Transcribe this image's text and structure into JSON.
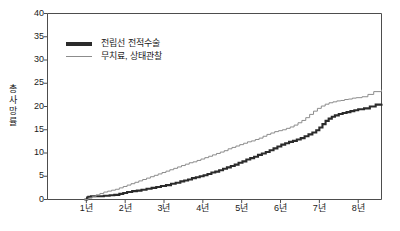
{
  "chart_data": {
    "type": "line",
    "title": "",
    "subtitle": "",
    "xlabel": "",
    "ylabel": "총사망률",
    "xlim": [
      0,
      8.6
    ],
    "ylim": [
      0,
      40
    ],
    "grid": false,
    "legend_position": "top-left",
    "x_ticks": [
      {
        "value": 1,
        "label": "1년"
      },
      {
        "value": 2,
        "label": "2년"
      },
      {
        "value": 3,
        "label": "3년"
      },
      {
        "value": 4,
        "label": "4년"
      },
      {
        "value": 5,
        "label": "5년"
      },
      {
        "value": 6,
        "label": "6년"
      },
      {
        "value": 7,
        "label": "7년"
      },
      {
        "value": 8,
        "label": "8년"
      }
    ],
    "y_ticks": [
      {
        "value": 0,
        "label": "0"
      },
      {
        "value": 5,
        "label": "5"
      },
      {
        "value": 10,
        "label": "10"
      },
      {
        "value": 15,
        "label": "15"
      },
      {
        "value": 20,
        "label": "20"
      },
      {
        "value": 25,
        "label": "25"
      },
      {
        "value": 30,
        "label": "30"
      },
      {
        "value": 35,
        "label": "35"
      },
      {
        "value": 40,
        "label": "40"
      }
    ],
    "series": [
      {
        "name": "전립선 전적수술",
        "color": "#2b2b2b",
        "width": 2.1,
        "step": true,
        "x": [
          0.95,
          1.02,
          1.05,
          1.12,
          1.3,
          1.45,
          1.6,
          1.72,
          1.85,
          1.95,
          2.05,
          2.18,
          2.3,
          2.42,
          2.55,
          2.68,
          2.8,
          2.92,
          3.05,
          3.18,
          3.3,
          3.42,
          3.52,
          3.62,
          3.72,
          3.82,
          3.92,
          4.02,
          4.12,
          4.22,
          4.32,
          4.42,
          4.52,
          4.62,
          4.72,
          4.82,
          4.92,
          5.02,
          5.12,
          5.22,
          5.32,
          5.42,
          5.52,
          5.62,
          5.72,
          5.82,
          5.92,
          6.02,
          6.12,
          6.22,
          6.32,
          6.42,
          6.52,
          6.62,
          6.72,
          6.82,
          6.92,
          7.0,
          7.08,
          7.16,
          7.24,
          7.32,
          7.4,
          7.5,
          7.6,
          7.7,
          7.8,
          7.9,
          8.0,
          8.15,
          8.3,
          8.45,
          8.6
        ],
        "y": [
          0.0,
          0.4,
          0.6,
          0.7,
          0.7,
          0.8,
          0.9,
          1.0,
          1.2,
          1.4,
          1.6,
          1.8,
          1.9,
          2.1,
          2.3,
          2.5,
          2.7,
          2.9,
          3.1,
          3.4,
          3.6,
          3.9,
          4.1,
          4.3,
          4.6,
          4.8,
          5.0,
          5.2,
          5.5,
          5.8,
          6.0,
          6.3,
          6.6,
          6.9,
          7.2,
          7.5,
          7.9,
          8.2,
          8.6,
          8.9,
          9.2,
          9.6,
          9.9,
          10.2,
          10.6,
          11.0,
          11.4,
          11.8,
          12.1,
          12.4,
          12.6,
          12.9,
          13.2,
          13.6,
          14.0,
          14.4,
          14.9,
          15.5,
          16.2,
          16.9,
          17.4,
          17.8,
          18.1,
          18.4,
          18.6,
          18.8,
          19.0,
          19.2,
          19.4,
          19.6,
          20.0,
          20.4,
          20.6
        ]
      },
      {
        "name": "무치료, 상태관찰",
        "color": "#8c8c8c",
        "width": 1.0,
        "step": true,
        "x": [
          0.95,
          1.05,
          1.15,
          1.25,
          1.35,
          1.45,
          1.55,
          1.65,
          1.75,
          1.85,
          1.95,
          2.05,
          2.15,
          2.25,
          2.35,
          2.45,
          2.55,
          2.65,
          2.75,
          2.85,
          2.95,
          3.05,
          3.15,
          3.25,
          3.35,
          3.45,
          3.55,
          3.65,
          3.75,
          3.85,
          3.95,
          4.05,
          4.15,
          4.25,
          4.35,
          4.45,
          4.55,
          4.65,
          4.75,
          4.85,
          4.95,
          5.05,
          5.15,
          5.25,
          5.35,
          5.45,
          5.55,
          5.65,
          5.75,
          5.85,
          5.95,
          6.05,
          6.15,
          6.25,
          6.35,
          6.45,
          6.55,
          6.65,
          6.75,
          6.85,
          6.95,
          7.05,
          7.15,
          7.25,
          7.35,
          7.45,
          7.55,
          7.65,
          7.75,
          7.85,
          7.95,
          8.1,
          8.25,
          8.4,
          8.6
        ],
        "y": [
          0.0,
          0.3,
          0.6,
          1.0,
          1.3,
          1.6,
          1.8,
          2.0,
          2.2,
          2.5,
          2.8,
          3.1,
          3.4,
          3.7,
          4.0,
          4.3,
          4.6,
          4.9,
          5.2,
          5.5,
          5.8,
          6.1,
          6.4,
          6.7,
          7.0,
          7.3,
          7.6,
          7.9,
          8.1,
          8.4,
          8.7,
          9.0,
          9.3,
          9.6,
          9.9,
          10.2,
          10.5,
          10.9,
          11.2,
          11.5,
          11.8,
          12.1,
          12.4,
          12.6,
          12.9,
          13.2,
          13.6,
          14.0,
          14.3,
          14.6,
          14.8,
          15.0,
          15.3,
          15.6,
          16.0,
          16.5,
          17.0,
          17.6,
          18.3,
          19.0,
          19.6,
          20.1,
          20.5,
          20.8,
          21.0,
          21.2,
          21.3,
          21.5,
          21.6,
          21.8,
          21.9,
          22.1,
          22.6,
          23.2,
          23.6
        ]
      }
    ]
  },
  "legend": {
    "items": [
      {
        "label": "전립선 전적수술"
      },
      {
        "label": "무치료, 상태관찰"
      }
    ]
  },
  "axis": {
    "y_title": "총사망률"
  }
}
